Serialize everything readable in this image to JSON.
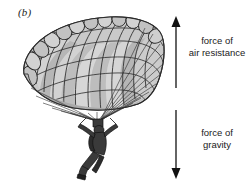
{
  "figure": {
    "panel_label": "(b)",
    "type": "physics-force-diagram",
    "background_color": "#ffffff",
    "ink_color": "#1a1a1a"
  },
  "labels": {
    "air_resistance": {
      "line1": "force of",
      "line2": "air resistance"
    },
    "gravity": {
      "line1": "force of",
      "line2": "gravity"
    }
  },
  "arrows": {
    "up": {
      "name": "air-resistance-arrow",
      "direction": "up",
      "x": 176,
      "y_top": 17,
      "y_bottom": 88,
      "color": "#111111"
    },
    "down": {
      "name": "gravity-arrow",
      "direction": "down",
      "x": 176,
      "y_top": 110,
      "y_bottom": 179,
      "color": "#111111"
    }
  },
  "illustration": {
    "canopy": {
      "name": "parachute-canopy",
      "style": "ram-air-cell-canopy",
      "fill_light": "#d3d3d3",
      "fill_mid": "#bdbdbd",
      "fill_dark": "#a8a8a8",
      "stroke": "#2b2b2b"
    },
    "lines": {
      "name": "suspension-lines",
      "count": 22,
      "stroke": "#2b2b2b",
      "converge_x": 97,
      "converge_y": 121
    },
    "skydiver": {
      "name": "skydiver-figure",
      "fill": "#3a3a3a",
      "stroke": "#111111"
    }
  }
}
